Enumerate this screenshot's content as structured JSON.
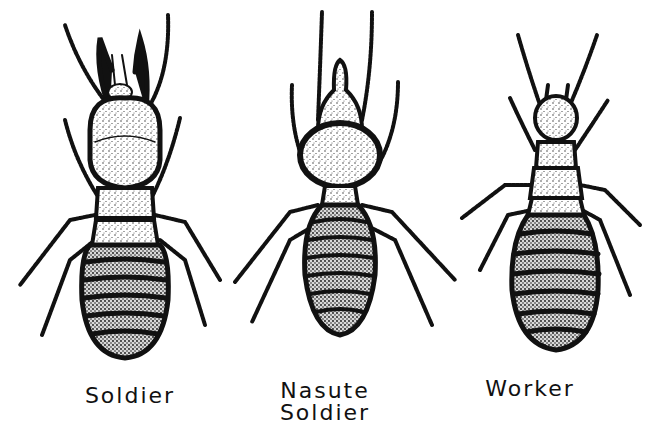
{
  "figure": {
    "background": "#ffffff",
    "ink": "#111111",
    "castes": [
      {
        "id": "soldier",
        "label": "Soldier"
      },
      {
        "id": "nasute-soldier",
        "label_line1": "Nasute",
        "label_line2": "Soldier"
      },
      {
        "id": "worker",
        "label": "Worker"
      }
    ]
  }
}
